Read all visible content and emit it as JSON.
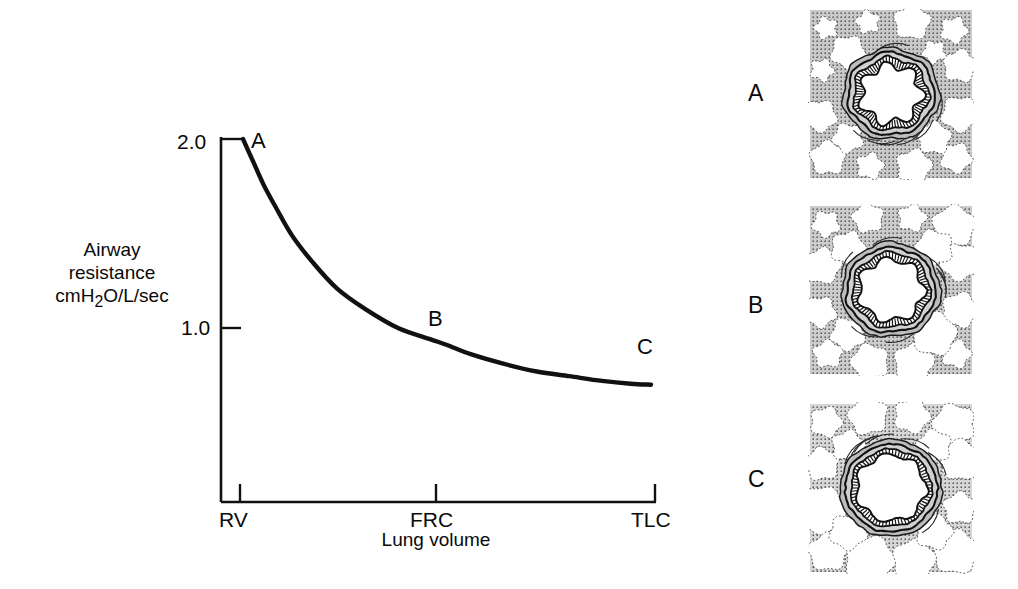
{
  "figure": {
    "panel_letters": [
      "A",
      "B",
      "C"
    ]
  },
  "chart_data": {
    "type": "line",
    "title": "",
    "subtitle": "",
    "xlabel": "Lung volume",
    "ylabel": "Airway resistance cmH2O/L/sec",
    "ylabel_lines": [
      "Airway",
      "resistance",
      "cmH",
      "2",
      "O/L/sec"
    ],
    "grid": false,
    "legend": "none",
    "x_tick_labels": [
      "RV",
      "FRC",
      "TLC"
    ],
    "x_tick_values": [
      0,
      0.5,
      1.0
    ],
    "y_tick_labels": [
      "2.0",
      "1.0"
    ],
    "y_tick_values": [
      2.0,
      1.0
    ],
    "xlim": [
      0,
      1.0
    ],
    "ylim": [
      0,
      2.15
    ],
    "x": [
      0.0,
      0.025,
      0.05,
      0.08,
      0.12,
      0.17,
      0.23,
      0.3,
      0.38,
      0.46,
      0.5,
      0.56,
      0.64,
      0.72,
      0.8,
      0.88,
      0.95,
      1.0
    ],
    "y": [
      2.0,
      1.88,
      1.76,
      1.64,
      1.49,
      1.35,
      1.21,
      1.1,
      1.0,
      0.94,
      0.91,
      0.86,
      0.81,
      0.77,
      0.745,
      0.72,
      0.705,
      0.7
    ],
    "annotations": [
      {
        "label": "A",
        "x": 0.0,
        "y": 2.0,
        "note": "Residual volume - highest airway resistance"
      },
      {
        "label": "B",
        "x": 0.5,
        "y": 0.91,
        "note": "Functional residual capacity - intermediate resistance"
      },
      {
        "label": "C",
        "x": 1.0,
        "y": 0.7,
        "note": "Total lung capacity - lowest airway resistance"
      }
    ],
    "colors": {
      "curve": "#111111",
      "axis": "#111111",
      "background": "#ffffff"
    }
  },
  "histology": {
    "caption_note": "Airway cross-sections at three lung volumes",
    "panels": [
      {
        "letter": "A",
        "lumen_state": "narrow star-shaped lumen",
        "lumen_scale": 0.62,
        "parenchyma_tone": "#c9c9c9",
        "alveoli": "small, densely packed"
      },
      {
        "letter": "B",
        "lumen_state": "moderately open lumen",
        "lumen_scale": 0.78,
        "parenchyma_tone": "#cccccc",
        "alveoli": "medium, moderately expanded"
      },
      {
        "letter": "C",
        "lumen_state": "widely open rounded lumen",
        "lumen_scale": 0.95,
        "parenchyma_tone": "#d6d6d6",
        "alveoli": "large, fully expanded"
      }
    ]
  }
}
